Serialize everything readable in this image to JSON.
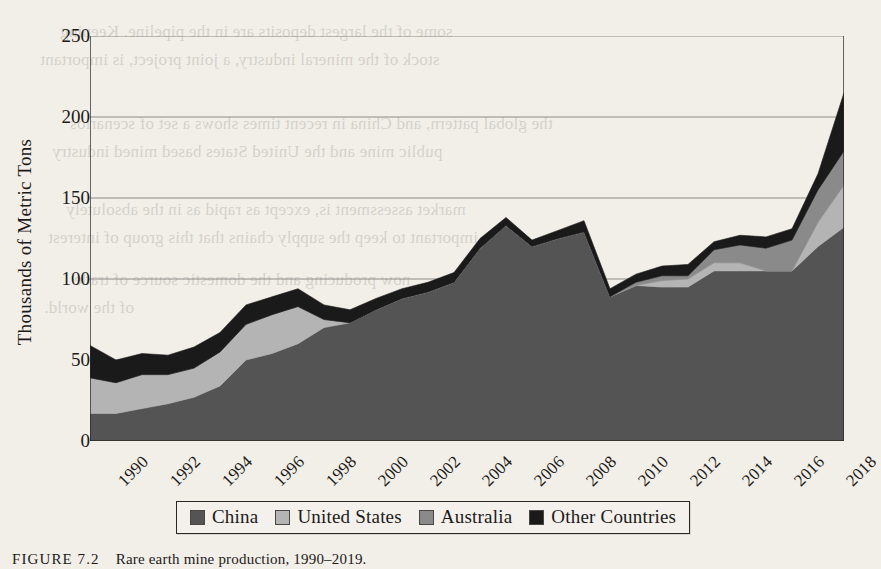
{
  "figure": {
    "caption_label": "FIGURE 7.2",
    "caption_text": "Rare earth mine production, 1990–2019."
  },
  "axes": {
    "ylabel": "Thousands of Metric Tons",
    "yticks": [
      0,
      50,
      100,
      150,
      200,
      250
    ],
    "xticks": [
      "1990",
      "1992",
      "1994",
      "1996",
      "1998",
      "2000",
      "2002",
      "2004",
      "2006",
      "2008",
      "2010",
      "2012",
      "2014",
      "2016",
      "2018"
    ]
  },
  "legend": {
    "position": "bottom-center",
    "items": [
      {
        "label": "China",
        "color": "#545454"
      },
      {
        "label": "United States",
        "color": "#b4b4b4"
      },
      {
        "label": "Australia",
        "color": "#8a8a8a"
      },
      {
        "label": "Other Countries",
        "color": "#1a1a1a"
      }
    ]
  },
  "bleed_through_lines": [
    "some of the largest deposits are in the pipeline. Keeping",
    "stock of the mineral industry, a joint project, is important",
    "the global pattern, and China in recent times shows a set of scenarios",
    "public mine and the United States based mined industry",
    "market assessment is, except as rapid as in the absolutely",
    "important to keep the supply chains that this group of interest",
    "now producing and the domestic source of trade",
    "of the world."
  ],
  "chart_data": {
    "type": "area",
    "stacked": true,
    "title": "Rare earth mine production, 1990–2019",
    "xlabel": "",
    "ylabel": "Thousands of Metric Tons",
    "ylim": [
      0,
      250
    ],
    "xlim": [
      1990,
      2019
    ],
    "grid": "horizontal",
    "x": [
      1990,
      1991,
      1992,
      1993,
      1994,
      1995,
      1996,
      1997,
      1998,
      1999,
      2000,
      2001,
      2002,
      2003,
      2004,
      2005,
      2006,
      2007,
      2008,
      2009,
      2010,
      2011,
      2012,
      2013,
      2014,
      2015,
      2016,
      2017,
      2018,
      2019
    ],
    "series": [
      {
        "name": "China",
        "color": "#545454",
        "values": [
          17,
          17,
          20,
          23,
          27,
          34,
          50,
          54,
          60,
          70,
          73,
          81,
          88,
          92,
          98,
          119,
          133,
          120,
          125,
          129,
          89,
          96,
          95,
          95,
          105,
          105,
          105,
          105,
          120,
          132
        ]
      },
      {
        "name": "United States",
        "color": "#b4b4b4",
        "values": [
          22,
          19,
          21,
          18,
          18,
          21,
          22,
          24,
          23,
          5,
          0,
          0,
          0,
          0,
          0,
          0,
          0,
          0,
          0,
          0,
          0,
          0,
          4,
          5,
          5,
          5,
          0,
          0,
          15,
          26
        ]
      },
      {
        "name": "Australia",
        "color": "#8a8a8a",
        "values": [
          0,
          0,
          0,
          0,
          0,
          0,
          0,
          0,
          0,
          0,
          0,
          0,
          0,
          0,
          0,
          0,
          0,
          0,
          0,
          0,
          0,
          2,
          3,
          2,
          8,
          11,
          14,
          19,
          20,
          21
        ]
      },
      {
        "name": "Other Countries",
        "color": "#1a1a1a",
        "values": [
          20,
          14,
          13,
          12,
          13,
          12,
          12,
          11,
          11,
          9,
          8,
          7,
          6,
          6,
          6,
          6,
          5,
          4,
          5,
          7,
          5,
          5,
          6,
          7,
          5,
          6,
          7,
          7,
          10,
          36
        ]
      }
    ],
    "totals": [
      59,
      50,
      54,
      53,
      58,
      67,
      84,
      89,
      94,
      84,
      81,
      88,
      94,
      98,
      104,
      125,
      138,
      124,
      130,
      136,
      94,
      103,
      108,
      109,
      123,
      127,
      126,
      131,
      165,
      215
    ]
  }
}
